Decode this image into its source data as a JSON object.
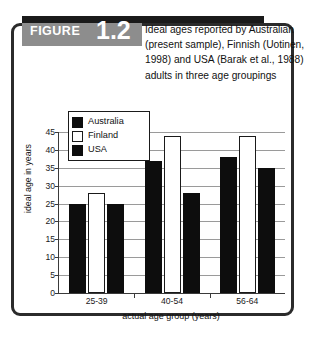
{
  "figure": {
    "word": "FIGURE",
    "number": "1.2",
    "caption": "Ideal ages reported by Australian (present sample), Finnish (Uotinen, 1998) and USA (Barak et al., 1988) adults in three age groupings"
  },
  "colors": {
    "bar_dark": "#0d0d0d",
    "bar_light": "#ffffff",
    "outline": "#1a1a1a",
    "grid": "#9a9a9a",
    "axis": "#3a3a3a",
    "band_gray": "#8d8d8d",
    "band_black": "#1a1a1a",
    "frame": "#2b2b2b"
  },
  "legend": {
    "position": "inside-top-left",
    "items": [
      {
        "label": "Australia",
        "style": "dark"
      },
      {
        "label": "Finland",
        "style": "light"
      },
      {
        "label": "USA",
        "style": "dark"
      }
    ]
  },
  "chart_data": {
    "type": "bar",
    "title": "Ideal ages reported by Australian (present sample), Finnish (Uotinen, 1998) and USA (Barak et al., 1988) adults in three age groupings",
    "xlabel": "actual age group (years)",
    "ylabel": "ideal age in years",
    "categories": [
      "25-39",
      "40-54",
      "56-64"
    ],
    "series": [
      {
        "name": "Australia",
        "values": [
          25,
          37,
          38
        ]
      },
      {
        "name": "Finland",
        "values": [
          28,
          44,
          44
        ]
      },
      {
        "name": "USA",
        "values": [
          25,
          28,
          35
        ]
      }
    ],
    "ylim": [
      0,
      45
    ],
    "yticks": [
      0,
      5,
      10,
      15,
      20,
      25,
      30,
      35,
      40,
      45
    ],
    "ytick_labels": [
      "0",
      "5",
      "10",
      "15",
      "20",
      "25",
      "30",
      "35",
      "40",
      "45"
    ],
    "grid": true,
    "grid_axis": "y",
    "legend_entries": [
      "Australia",
      "Finland",
      "USA"
    ]
  }
}
